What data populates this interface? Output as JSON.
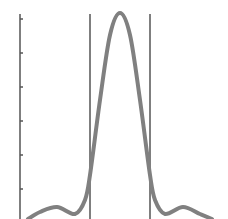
{
  "chart_data": {
    "type": "line",
    "title": "",
    "xlabel": "",
    "ylabel": "",
    "grid": false,
    "legend": null,
    "series": [
      {
        "name": "curve",
        "color": "#808080",
        "points": [
          {
            "x": 28,
            "y": 219
          },
          {
            "x": 40,
            "y": 212
          },
          {
            "x": 57,
            "y": 207
          },
          {
            "x": 75,
            "y": 214
          },
          {
            "x": 85,
            "y": 200
          },
          {
            "x": 90,
            "y": 175
          },
          {
            "x": 100,
            "y": 100
          },
          {
            "x": 110,
            "y": 35
          },
          {
            "x": 120,
            "y": 13
          },
          {
            "x": 130,
            "y": 35
          },
          {
            "x": 140,
            "y": 100
          },
          {
            "x": 150,
            "y": 175
          },
          {
            "x": 155,
            "y": 200
          },
          {
            "x": 165,
            "y": 214
          },
          {
            "x": 183,
            "y": 207
          },
          {
            "x": 200,
            "y": 214
          },
          {
            "x": 212,
            "y": 219
          }
        ]
      }
    ],
    "vertical_lines": [
      {
        "x": 90,
        "color": "#555555"
      },
      {
        "x": 150,
        "color": "#555555"
      }
    ],
    "y_axis": {
      "x": 20,
      "color": "#555555",
      "ticks_y": [
        19,
        53,
        87,
        121,
        155,
        189
      ],
      "tick_labels": []
    }
  }
}
